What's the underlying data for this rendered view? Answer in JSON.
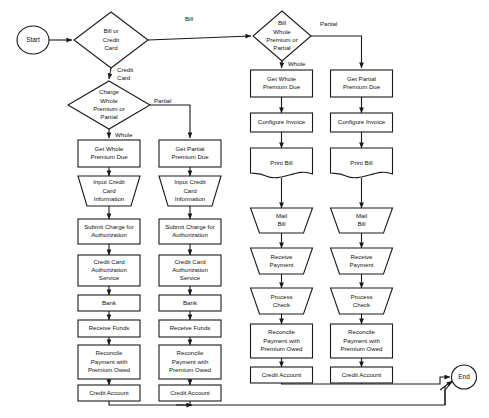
{
  "diagram": {
    "colors": {
      "stroke": "#1a1a1a",
      "fill": "#ffffff",
      "text": "#111111"
    },
    "terminators": {
      "start": "Start",
      "end": "End"
    },
    "decisions": {
      "d1": "Bill or Credit Card",
      "d2": "Charge Whole Premium or Partial",
      "d3": "Bill Whole Premium or Partial"
    },
    "decision_lines": {
      "d1": [
        "Bill or",
        "Credit",
        "Card"
      ],
      "d2": [
        "Charge",
        "Whole",
        "Premium or",
        "Partial"
      ],
      "d3": [
        "Bill",
        "Whole",
        "Premium or",
        "Partial"
      ]
    },
    "edge_labels": {
      "bill": "Bill",
      "credit_card_1": "Credit",
      "credit_card_2": "Card",
      "partial_left": "Partial",
      "whole_left": "Whole",
      "partial_right": "Partial",
      "whole_right": "Whole"
    },
    "columns": [
      {
        "id": "cc-whole",
        "branch": "Credit Card - Whole Premium",
        "nodes": [
          {
            "id": "c1n1",
            "shape": "process",
            "lines": [
              "Get Whole",
              "Premium Due"
            ]
          },
          {
            "id": "c1n2",
            "shape": "manual-input",
            "lines": [
              "Input Credit",
              "Card",
              "Information"
            ]
          },
          {
            "id": "c1n3",
            "shape": "process",
            "lines": [
              "Submit Charge for",
              "Authorization"
            ]
          },
          {
            "id": "c1n4",
            "shape": "process",
            "lines": [
              "Credit Card",
              "Authorization",
              "Service"
            ]
          },
          {
            "id": "c1n5",
            "shape": "process",
            "lines": [
              "Bank"
            ]
          },
          {
            "id": "c1n6",
            "shape": "process",
            "lines": [
              "Receive Funds"
            ]
          },
          {
            "id": "c1n7",
            "shape": "process",
            "lines": [
              "Reconcile",
              "Payment with",
              "Premium Owed"
            ]
          },
          {
            "id": "c1n8",
            "shape": "process",
            "lines": [
              "Credit Account"
            ]
          }
        ]
      },
      {
        "id": "cc-partial",
        "branch": "Credit Card - Partial Premium",
        "nodes": [
          {
            "id": "c2n1",
            "shape": "process",
            "lines": [
              "Get Partial",
              "Premium Due"
            ]
          },
          {
            "id": "c2n2",
            "shape": "manual-input",
            "lines": [
              "Input Credit",
              "Card",
              "Information"
            ]
          },
          {
            "id": "c2n3",
            "shape": "process",
            "lines": [
              "Submit Charge for",
              "Authorization"
            ]
          },
          {
            "id": "c2n4",
            "shape": "process",
            "lines": [
              "Credit Card",
              "Authorization",
              "Service"
            ]
          },
          {
            "id": "c2n5",
            "shape": "process",
            "lines": [
              "Bank"
            ]
          },
          {
            "id": "c2n6",
            "shape": "process",
            "lines": [
              "Receive Funds"
            ]
          },
          {
            "id": "c2n7",
            "shape": "process",
            "lines": [
              "Reconcile",
              "Payment with",
              "Premium Owed"
            ]
          },
          {
            "id": "c2n8",
            "shape": "process",
            "lines": [
              "Credit Account"
            ]
          }
        ]
      },
      {
        "id": "bill-whole",
        "branch": "Bill - Whole Premium",
        "nodes": [
          {
            "id": "c3n1",
            "shape": "process",
            "lines": [
              "Get Whole",
              "Premium Due"
            ]
          },
          {
            "id": "c3n2",
            "shape": "process",
            "lines": [
              "Configure Invoice"
            ]
          },
          {
            "id": "c3n3",
            "shape": "document",
            "lines": [
              "Print Bill"
            ]
          },
          {
            "id": "c3n4",
            "shape": "manual-operation",
            "lines": [
              "Mail",
              "Bill"
            ]
          },
          {
            "id": "c3n5",
            "shape": "manual-operation",
            "lines": [
              "Receive",
              "Payment"
            ]
          },
          {
            "id": "c3n6",
            "shape": "manual-operation",
            "lines": [
              "Process",
              "Check"
            ]
          },
          {
            "id": "c3n7",
            "shape": "process",
            "lines": [
              "Reconcile",
              "Payment with",
              "Premium Owed"
            ]
          },
          {
            "id": "c3n8",
            "shape": "process",
            "lines": [
              "Credit Account"
            ]
          }
        ]
      },
      {
        "id": "bill-partial",
        "branch": "Bill - Partial Premium",
        "nodes": [
          {
            "id": "c4n1",
            "shape": "process",
            "lines": [
              "Get Partial",
              "Premium Due"
            ]
          },
          {
            "id": "c4n2",
            "shape": "process",
            "lines": [
              "Configure Invoice"
            ]
          },
          {
            "id": "c4n3",
            "shape": "document",
            "lines": [
              "Print Bill"
            ]
          },
          {
            "id": "c4n4",
            "shape": "manual-operation",
            "lines": [
              "Mail",
              "Bill"
            ]
          },
          {
            "id": "c4n5",
            "shape": "manual-operation",
            "lines": [
              "Receive",
              "Payment"
            ]
          },
          {
            "id": "c4n6",
            "shape": "manual-operation",
            "lines": [
              "Process",
              "Check"
            ]
          },
          {
            "id": "c4n7",
            "shape": "process",
            "lines": [
              "Reconcile",
              "Payment with",
              "Premium Owed"
            ]
          },
          {
            "id": "c4n8",
            "shape": "process",
            "lines": [
              "Credit Account"
            ]
          }
        ]
      }
    ]
  }
}
